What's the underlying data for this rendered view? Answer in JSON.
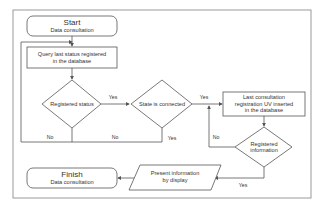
{
  "diagram": {
    "type": "flowchart",
    "colors": {
      "stroke": "#555555",
      "text": "#333333",
      "background": "#ffffff",
      "frame": "#999999"
    },
    "nodes": {
      "start": {
        "title": "Start",
        "subtitle": "Data consultation"
      },
      "query": {
        "line1": "Query last status registered",
        "line2": "in the database"
      },
      "registered_status": {
        "label": "Registered status"
      },
      "state_connected": {
        "label": "State is connected"
      },
      "last_consultation": {
        "line1": "Last consultation",
        "line2": "registration UV inserted",
        "line3": "in the database"
      },
      "registered_information": {
        "line1": "Registered",
        "line2": "information"
      },
      "present_info": {
        "line1": "Present information",
        "line2": "by display"
      },
      "finish": {
        "title": "Finish",
        "subtitle": "Data consultation"
      }
    },
    "edges": {
      "reg_status_yes": "Yes",
      "reg_status_no": "No",
      "state_no": "No",
      "state_yes": "Yes",
      "state_to_last_yes": "Yes",
      "reg_info_no": "No",
      "reg_info_yes": "Yes"
    }
  }
}
